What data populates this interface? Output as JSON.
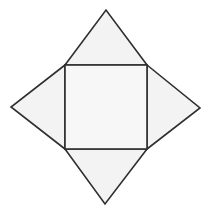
{
  "diagram": {
    "shape": "square-pyramid-net",
    "colors": {
      "background": "#ffffff",
      "face_fill": "#f3f3f3",
      "base_fill": "#f7f7f7",
      "stroke": "#2f2f2f"
    },
    "stroke_width": 1.6,
    "base_square": {
      "x1": 65,
      "y1": 65,
      "x2": 147,
      "y2": 149
    },
    "triangles": [
      {
        "name": "top",
        "points": "65,65 106,10 147,65"
      },
      {
        "name": "left",
        "points": "65,65 11,107 65,149"
      },
      {
        "name": "right",
        "points": "147,65 200,108 147,149"
      },
      {
        "name": "bottom",
        "points": "65,149 105,204 147,149"
      }
    ]
  }
}
